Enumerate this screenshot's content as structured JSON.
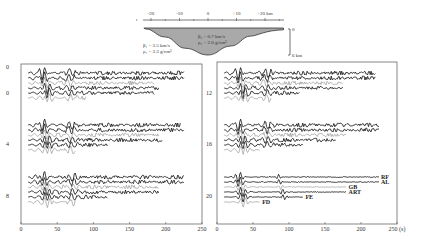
{
  "chart_data": [
    {
      "type": "diagram",
      "title": "Basin cross-section",
      "x_axis": {
        "ticks": [
          "-20",
          "-10",
          "0",
          "+10",
          "+20 km"
        ],
        "values": [
          -20,
          -10,
          0,
          10,
          20
        ],
        "unit": "km"
      },
      "outer_medium": {
        "beta": "β₁ = 3.5 km/s",
        "rho": "ρ₁ = 3.3 g/cm³"
      },
      "basin_medium": {
        "beta": "β₂ = 0.7 km/s",
        "rho": "ρ₂ = 2.0 g/cm³"
      },
      "depth_scale": {
        "top_label": "0",
        "bottom_label": "6 km",
        "max_depth_km": 6
      },
      "basin_shape": {
        "x_km": [
          -22,
          -15,
          -8,
          0,
          8,
          15,
          22
        ],
        "depth_km": [
          0.2,
          2.0,
          4.5,
          6.0,
          4.0,
          1.8,
          0.5
        ]
      }
    },
    {
      "type": "line",
      "title": "Seismograms (left panel)",
      "xlabel": "",
      "xlim": [
        0,
        250
      ],
      "x_ticks": [
        "0",
        "50",
        "100",
        "150",
        "200",
        "250"
      ],
      "y_labels": [
        {
          "text": "0",
          "station_km": 0,
          "row": "top"
        },
        {
          "text": "0",
          "station_km": 0
        },
        {
          "text": "4",
          "station_km": 4
        },
        {
          "text": "8",
          "station_km": 8
        }
      ],
      "groups": [
        {
          "station_km": 0,
          "trace_ends_s": [
            225,
            225,
            185,
            190,
            185,
            90
          ],
          "first_arrival_s": 10
        },
        {
          "station_km": 4,
          "trace_ends_s": [
            220,
            225,
            190,
            195,
            120,
            75
          ],
          "first_arrival_s": 10
        },
        {
          "station_km": 8,
          "trace_ends_s": [
            225,
            225,
            190,
            190,
            120,
            75
          ],
          "first_arrival_s": 10
        }
      ]
    },
    {
      "type": "line",
      "title": "Seismograms (right panel)",
      "xlabel": "(s)",
      "xlim": [
        0,
        250
      ],
      "x_ticks": [
        "0",
        "50",
        "100",
        "150",
        "200",
        "250 (s)"
      ],
      "y_labels": [
        {
          "text": "12",
          "station_km": 12
        },
        {
          "text": "16",
          "station_km": 16
        },
        {
          "text": "20",
          "station_km": 20
        }
      ],
      "groups": [
        {
          "station_km": 12,
          "trace_ends_s": [
            220,
            220,
            175,
            175,
            115,
            75
          ],
          "first_arrival_s": 10
        },
        {
          "station_km": 16,
          "trace_ends_s": [
            225,
            225,
            180,
            165,
            120,
            60
          ],
          "first_arrival_s": 10
        },
        {
          "station_km": 20,
          "trace_ends_s": [
            225,
            225,
            180,
            180,
            120,
            60
          ],
          "first_arrival_s": 10
        }
      ],
      "legend": [
        {
          "label": "RF",
          "row": 0
        },
        {
          "label": "AL",
          "row": 1
        },
        {
          "label": "GB",
          "row": 2
        },
        {
          "label": "ART",
          "row": 3
        },
        {
          "label": "FE",
          "row": 4
        },
        {
          "label": "FD",
          "row": 5
        }
      ]
    }
  ],
  "colors": {
    "trace_dark": "#222222",
    "trace_gray": "#888888",
    "basin_fill": "#a9a9a9",
    "frame": "#555555"
  }
}
